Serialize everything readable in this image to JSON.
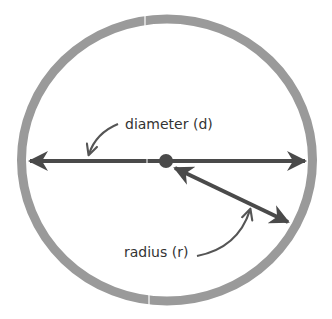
{
  "diagram": {
    "labels": {
      "diameter": "diameter (d)",
      "radius": "radius (r)"
    },
    "colors": {
      "ring": "#9a9a9a",
      "line": "#4a4a4a",
      "text": "#333333",
      "background": "#ffffff"
    },
    "shapes": {
      "circle": {
        "cx": 167,
        "cy": 160,
        "rx": 145,
        "ry": 141,
        "stroke_width": 9
      },
      "center_point": {
        "cx": 166,
        "cy": 161,
        "r": 7
      },
      "diameter_line": {
        "x1": 28,
        "y1": 161,
        "x2": 306,
        "y2": 161
      },
      "radius_line": {
        "x1": 173,
        "y1": 167,
        "x2": 289,
        "y2": 222
      }
    }
  }
}
